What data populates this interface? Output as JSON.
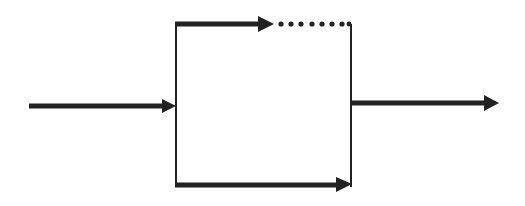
{
  "diagram": {
    "type": "parallel-branch-flow",
    "stroke_color": "#222222",
    "background": "#ffffff",
    "elements": {
      "input_arrow": {
        "from": [
          29,
          106
        ],
        "to": [
          176,
          106
        ],
        "style": "solid-arrow"
      },
      "split_line": {
        "x": 176,
        "y1": 24,
        "y2": 186,
        "style": "thin-line"
      },
      "top_branch_arrow": {
        "from": [
          176,
          24
        ],
        "to": [
          272,
          24
        ],
        "style": "solid-arrow"
      },
      "top_branch_dotted": {
        "from": [
          272,
          24
        ],
        "to": [
          350,
          24
        ],
        "style": "dotted"
      },
      "bottom_branch_arrow": {
        "from": [
          176,
          185
        ],
        "to": [
          351,
          185
        ],
        "style": "solid-arrow"
      },
      "merge_line": {
        "x": 351,
        "y1": 24,
        "y2": 186,
        "style": "thin-line"
      },
      "output_arrow": {
        "from": [
          351,
          103
        ],
        "to": [
          498,
          103
        ],
        "style": "solid-arrow"
      }
    }
  }
}
